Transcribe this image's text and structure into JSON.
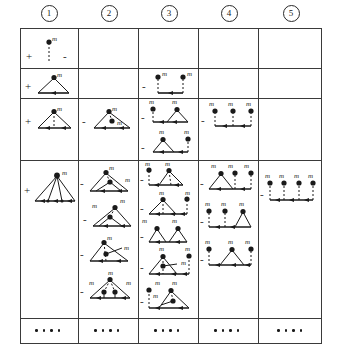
{
  "figure": {
    "type": "diagram-table",
    "caption": "",
    "columns": 5,
    "rows": 5,
    "vertex_label": "m",
    "signs": [
      "+",
      "-"
    ],
    "ink_color": "#1a1a1a",
    "rule_color": "#3a3a3a",
    "background": "#ffffff"
  },
  "header": {
    "labels": [
      "1",
      "2",
      "3",
      "4",
      "5"
    ]
  },
  "grid": {
    "col_x": [
      0,
      58,
      118,
      178,
      238,
      302
    ],
    "row_y": [
      0,
      40,
      70,
      132,
      290,
      316
    ]
  },
  "cells": [
    {
      "row": 0,
      "col": 0,
      "items": [
        {
          "sign": "+",
          "kind": "stalk",
          "vertices": 1,
          "labels": [
            "m"
          ],
          "minus_right": "-"
        }
      ]
    },
    {
      "row": 1,
      "col": 0,
      "items": [
        {
          "sign": "+",
          "kind": "tri-1",
          "labels": [
            "m"
          ]
        }
      ]
    },
    {
      "row": 1,
      "col": 2,
      "items": [
        {
          "sign": "-",
          "kind": "two-stalk",
          "labels": [
            "m",
            "m"
          ]
        }
      ]
    },
    {
      "row": 2,
      "col": 0,
      "items": [
        {
          "sign": "+",
          "kind": "tri-apex-drop",
          "labels": [
            "m"
          ]
        }
      ]
    },
    {
      "row": 2,
      "col": 1,
      "items": [
        {
          "sign": "-",
          "kind": "tri-inner",
          "labels": [
            "m",
            "m"
          ]
        }
      ]
    },
    {
      "row": 2,
      "col": 2,
      "items": [
        {
          "sign": "-",
          "kind": "stalk-plus-tri",
          "labels": [
            "m",
            "m"
          ]
        },
        {
          "sign": "-",
          "kind": "tri-plus-stalk",
          "labels": [
            "m",
            "m"
          ]
        }
      ]
    },
    {
      "row": 2,
      "col": 3,
      "items": [
        {
          "sign": "-",
          "kind": "three-stalk",
          "labels": [
            "m",
            "m",
            "m"
          ]
        }
      ]
    },
    {
      "row": 3,
      "col": 0,
      "items": [
        {
          "sign": "+",
          "kind": "fan4",
          "labels": [
            "m"
          ]
        }
      ]
    },
    {
      "row": 3,
      "col": 1,
      "items": [
        {
          "sign": "-",
          "kind": "tri-nested-apex",
          "labels": [
            "m",
            "m"
          ]
        },
        {
          "sign": "-",
          "kind": "tri-nested-left",
          "labels": [
            "m",
            "m"
          ]
        },
        {
          "sign": "-",
          "kind": "tri-drop-right",
          "labels": [
            "m",
            "m"
          ]
        },
        {
          "sign": "-",
          "kind": "tri-two-inner",
          "labels": [
            "m",
            "m",
            "m"
          ]
        }
      ]
    },
    {
      "row": 3,
      "col": 2,
      "items": [
        {
          "sign": "-",
          "kind": "tri-double-apex",
          "labels": [
            "m",
            "m"
          ]
        },
        {
          "sign": "-",
          "kind": "tri-apex-stalk-right",
          "labels": [
            "m",
            "m"
          ]
        },
        {
          "sign": "-",
          "kind": "tri-tri",
          "labels": [
            "m",
            "m"
          ]
        },
        {
          "sign": "-",
          "kind": "tri-inner-stalk",
          "labels": [
            "m",
            "m",
            "m"
          ]
        },
        {
          "sign": "-",
          "kind": "tri-inner-two",
          "labels": [
            "m",
            "m",
            "m"
          ]
        }
      ]
    },
    {
      "row": 3,
      "col": 3,
      "items": [
        {
          "sign": "-",
          "kind": "tri-stalk-stalk",
          "labels": [
            "m",
            "m",
            "m"
          ]
        },
        {
          "sign": "-",
          "kind": "stalk-stalk-tri",
          "labels": [
            "m",
            "m",
            "m"
          ]
        },
        {
          "sign": "-",
          "kind": "stalk-tri-stalk",
          "labels": [
            "m",
            "m",
            "m"
          ]
        }
      ]
    },
    {
      "row": 3,
      "col": 4,
      "items": [
        {
          "sign": "-",
          "kind": "four-stalk",
          "labels": [
            "m",
            "m",
            "m",
            "m"
          ]
        }
      ]
    }
  ],
  "dots_row": {
    "count_per_cell": 4,
    "cells": [
      0,
      1,
      2,
      3,
      4
    ]
  }
}
